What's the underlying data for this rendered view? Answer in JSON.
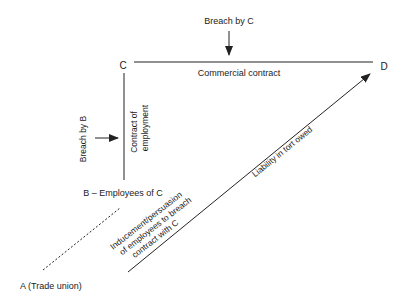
{
  "diagram": {
    "nodes": {
      "C": "C",
      "D": "D",
      "B": "B – Employees of C",
      "A": "A (Trade union)"
    },
    "labels": {
      "breach_by_c": "Breach by C",
      "commercial_contract": "Commercial contract",
      "breach_by_b": "Breach by B",
      "contract_of_employment_1": "Contract of",
      "contract_of_employment_2": "employment",
      "inducement_1": "Inducement/persuasion",
      "inducement_2": "of employees to breach",
      "inducement_3": "contract with C",
      "liability": "Liability in tort owed"
    },
    "colors": {
      "line": "#222222",
      "background": "#ffffff"
    }
  }
}
